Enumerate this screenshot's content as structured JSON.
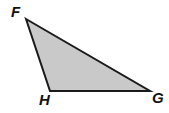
{
  "figure": {
    "name": "triangle-FHG",
    "type": "geometry-diagram",
    "background_color": "#ffffff",
    "fill_color": "#c9c9c9",
    "stroke_color": "#1a1a1a",
    "stroke_width": 2,
    "canvas": {
      "width": 169,
      "height": 113
    },
    "vertices": [
      {
        "id": "F",
        "label": "F",
        "x": 26,
        "y": 19,
        "label_x": 11,
        "label_y": 4
      },
      {
        "id": "H",
        "label": "H",
        "x": 50,
        "y": 91,
        "label_x": 39,
        "label_y": 92
      },
      {
        "id": "G",
        "label": "G",
        "x": 150,
        "y": 91,
        "label_x": 152,
        "label_y": 90
      }
    ],
    "edges": [
      {
        "from": "F",
        "to": "G"
      },
      {
        "from": "G",
        "to": "H"
      },
      {
        "from": "H",
        "to": "F"
      }
    ],
    "polygon_points": "26,19 150,91 50,91"
  }
}
